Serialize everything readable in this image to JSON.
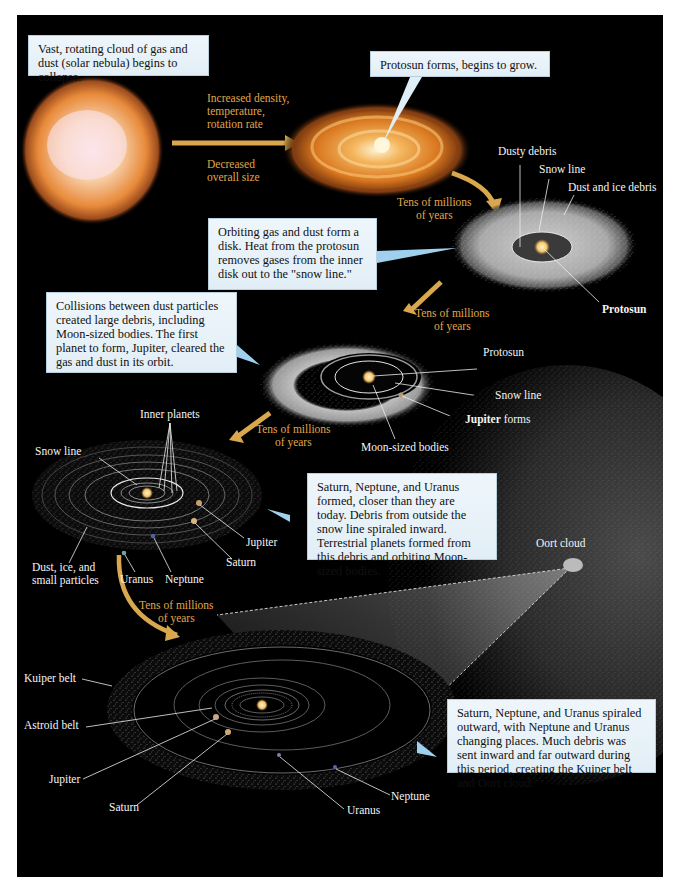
{
  "callouts": {
    "nebula": "Vast, rotating cloud of gas and dust (solar nebula) begins to collapse.",
    "protosun_forms": "Protosun forms, begins to grow.",
    "disk": "Orbiting gas and dust form a disk.  Heat from the protosun removes gases from the inner disk out to the \"snow line.\"",
    "collisions": "Collisions between dust particles created large debris, including Moon-sized bodies.  The first planet to form, Jupiter, cleared the gas and dust in its orbit.",
    "giants_formed": "Saturn, Neptune, and Uranus formed, closer than they are today.  Debris from outside the snow line spiraled inward.  Terrestrial planets formed from this debris and orbiting Moon-sized bodies.",
    "migration": "Saturn, Neptune, and Uranus spiraled outward, with Neptune and Uranus changing places.  Much debris was sent inward and far outward during this period, creating the Kuiper belt and Oort cloud."
  },
  "transitions": {
    "increased": "Increased density, temperature, rotation rate",
    "increased_lines": [
      "Increased density,",
      "temperature,",
      "rotation rate"
    ],
    "decreased_lines": [
      "Decreased",
      "overall size"
    ],
    "tens_lines": [
      "Tens of millions",
      "of years"
    ]
  },
  "stage3_labels": {
    "dusty_debris": "Dusty debris",
    "snow_line": "Snow line",
    "dust_ice_debris": "Dust and ice debris",
    "protosun": "Protosun"
  },
  "stage4_labels": {
    "protosun": "Protosun",
    "snow_line": "Snow line",
    "jupiter_bold": "Jupiter",
    "jupiter_rest": " forms",
    "moon_sized": "Moon-sized bodies"
  },
  "stage5_labels": {
    "inner_planets": "Inner planets",
    "snow_line": "Snow line",
    "jupiter": "Jupiter",
    "saturn": "Saturn",
    "uranus": "Uranus",
    "neptune": "Neptune",
    "dust_lines": [
      "Dust, ice, and",
      "small particles"
    ],
    "oort_cloud": "Oort cloud"
  },
  "stage6_labels": {
    "kuiper_belt": "Kuiper belt",
    "asteroid_belt": "Astroid belt",
    "jupiter": "Jupiter",
    "saturn": "Saturn",
    "uranus": "Uranus",
    "neptune": "Neptune"
  },
  "colors": {
    "background": "#000000",
    "page": "#ffffff",
    "arrow_gold": "#d9a84e",
    "time_label": "#e0a64a",
    "callout_bg": "#e8f2f8"
  }
}
